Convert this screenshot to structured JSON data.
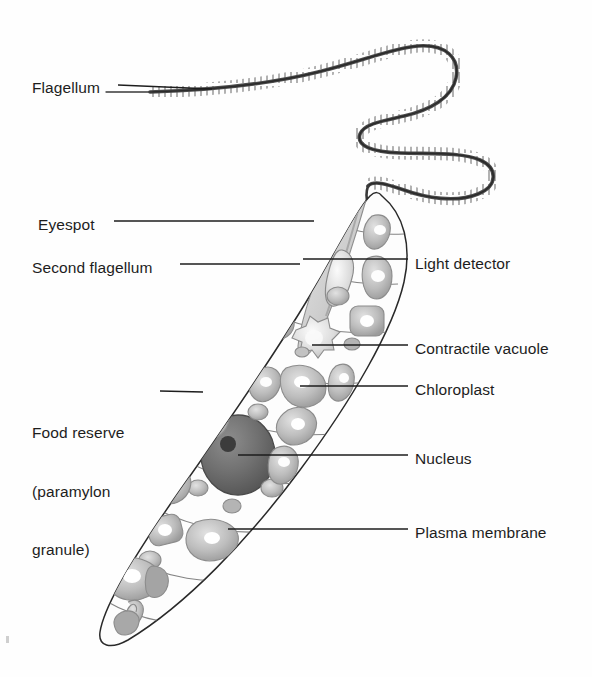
{
  "figure": {
    "style": "grayscale pencil-shaded biological line drawing",
    "background_color": "#ffffff",
    "line_color": "#1d1d1d",
    "text_color": "#1d1d1d"
  },
  "labels": {
    "flagellum": "Flagellum",
    "eyespot": "Eyespot",
    "second_flagellum": "Second flagellum",
    "food_reserve_line1": "Food reserve",
    "food_reserve_line2": "(paramylon",
    "food_reserve_line3": "granule)",
    "light_detector": "Light detector",
    "contractile_vacuole": "Contractile vacuole",
    "chloroplast": "Chloroplast",
    "nucleus": "Nucleus",
    "plasma_membrane": "Plasma membrane"
  },
  "label_positions": {
    "flagellum": {
      "x": 32,
      "y": 78,
      "side": "left"
    },
    "eyespot": {
      "x": 38,
      "y": 215,
      "side": "left"
    },
    "second_flagellum": {
      "x": 32,
      "y": 258,
      "side": "left"
    },
    "food_reserve": {
      "x": 32,
      "y": 384,
      "side": "left"
    },
    "light_detector": {
      "x": 415,
      "y": 254,
      "side": "right"
    },
    "contractile_vacuole": {
      "x": 415,
      "y": 339,
      "side": "right"
    },
    "chloroplast": {
      "x": 415,
      "y": 380,
      "side": "right"
    },
    "nucleus": {
      "x": 415,
      "y": 449,
      "side": "right"
    },
    "plasma_membrane": {
      "x": 415,
      "y": 523,
      "side": "right"
    }
  },
  "structures": {
    "cell_body": "elongated spindle-shaped cell tilted about 30 degrees, anterior upper-right, posterior tapering to a point at lower-left",
    "flagellum": "long wavy S-shaped flagellum with fine hair-like mastigonemes emerging from the anterior end",
    "second_flagellum": "short dark curved rod inside the anterior reservoir",
    "eyespot": "dark elongated oval pigment spot near anterior",
    "light_detector": "pale swollen photoreceptor body at base of flagellum",
    "reservoir": "pale channel (gullet) running from anterior opening inward",
    "contractile_vacuole": "pale star-shaped vacuole with spiky margin",
    "nucleus": "large dark grey sphere with a darker central nucleolus",
    "chloroplasts": "numerous grey amoeboid/oval chloroplasts with white highlights scattered through cytoplasm",
    "paramylon_granules": "small rounded grey granules",
    "pellicle": "curved striation bands crossing the cell body",
    "plasma_membrane": "outer boundary line of the cell"
  },
  "colors": {
    "outline": "#2a2a2a",
    "organelle_fill": "#b9b9b9",
    "organelle_edge": "#8c8c8c",
    "organelle_highlight": "#ffffff",
    "nucleus_fill": "#6e6e6e",
    "nucleolus": "#3f3f3f",
    "eyespot_fill": "#4b4b4b",
    "cytoplasm": "#fcfcfc",
    "leader_line": "#1d1d1d"
  }
}
